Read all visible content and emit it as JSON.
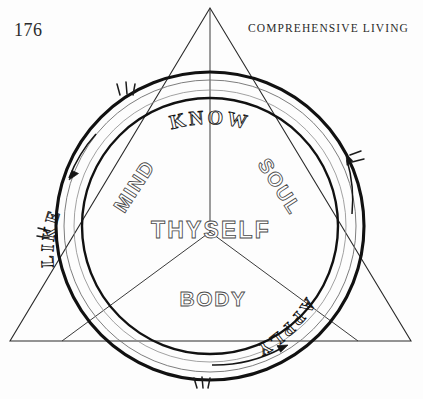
{
  "page": {
    "folio": "176",
    "running_head": "COMPREHENSIVE LIVING",
    "background_color": "#fdfdfd",
    "ink_color": "#1a1a1a"
  },
  "figure": {
    "name": "know-thyself-wheel-diagram",
    "center_label": "THYSELF",
    "triangle": {
      "name": "equilateral-triangle",
      "apex": [
        210,
        8
      ],
      "left_vertex": [
        10,
        341
      ],
      "right_vertex": [
        411,
        341
      ],
      "median_lines": 3,
      "center": [
        210,
        232
      ]
    },
    "ring": {
      "name": "rotating-band",
      "center": [
        210,
        226
      ],
      "outer_radius": 154,
      "inner_radius": 128,
      "direction": "counterclockwise",
      "arrow_count": 3,
      "motion_mark_count": 4
    },
    "ring_labels": [
      {
        "text": "KNOW",
        "position": "top",
        "angle_deg": 0
      },
      {
        "text": "APPLY",
        "position": "lower-right",
        "angle_deg": 125
      },
      {
        "text": "LIKE",
        "position": "lower-left",
        "angle_deg": 235
      }
    ],
    "inner_labels": [
      {
        "text": "MIND",
        "position": "upper-left",
        "angle_deg": -55
      },
      {
        "text": "SOUL",
        "position": "upper-right",
        "angle_deg": 55
      },
      {
        "text": "BODY",
        "position": "bottom",
        "angle_deg": 0
      },
      {
        "text": "THYSELF",
        "position": "center",
        "angle_deg": 0
      }
    ]
  }
}
